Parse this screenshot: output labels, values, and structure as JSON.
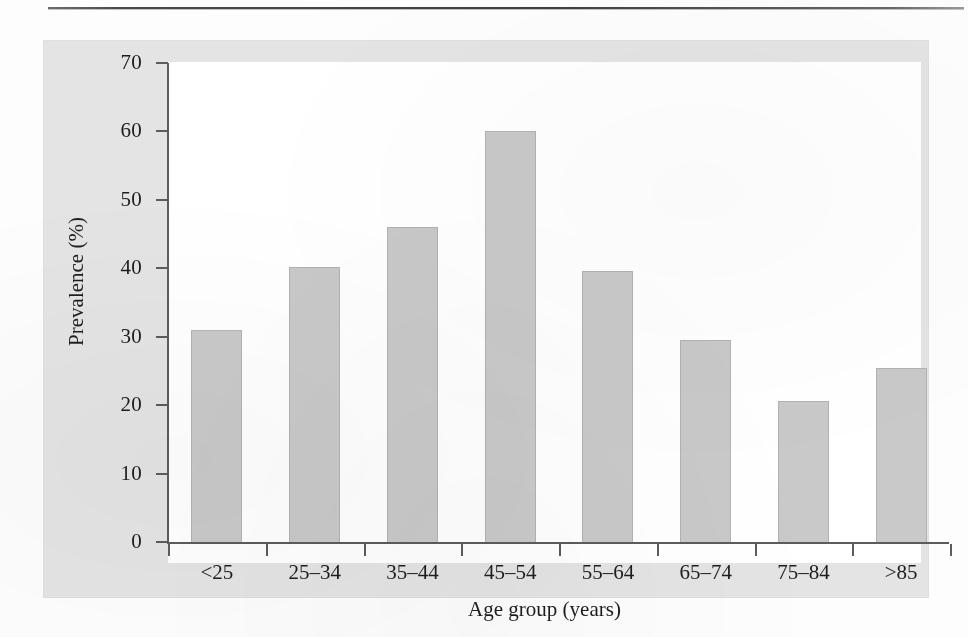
{
  "figure": {
    "panel_background": "#e4e4e4",
    "plot_background": "#ffffff",
    "bar_fill": "#c9c9c9",
    "bar_stroke": "#b2b2b2",
    "axis_color": "#5c5c5c",
    "text_color": "#1d1d1d",
    "rule_color": "#3f3f3f"
  },
  "chart_data": {
    "type": "bar",
    "title": "",
    "subtitle": "",
    "xlabel": "Age group (years)",
    "ylabel": "Prevalence (%)",
    "categories": [
      "<25",
      "25–34",
      "35–44",
      "45–54",
      "55–64",
      "65–74",
      "75–84",
      ">85"
    ],
    "values": [
      31.0,
      40.2,
      46.0,
      60.0,
      39.6,
      29.5,
      20.6,
      25.5
    ],
    "ylim": [
      0,
      70
    ],
    "yticks": [
      0,
      10,
      20,
      30,
      40,
      50,
      60,
      70
    ],
    "ytick_labels": [
      "0",
      "10",
      "20",
      "30",
      "40",
      "50",
      "60",
      "70"
    ],
    "xtick_labels": [
      "<25",
      "25–34",
      "35–44",
      "45–54",
      "55–64",
      "65–74",
      "75–84",
      ">85"
    ],
    "grid": false,
    "legend": null,
    "legend_position": "none",
    "annotations": [],
    "series": [
      {
        "name": "Prevalence",
        "values": [
          31.0,
          40.2,
          46.0,
          60.0,
          39.6,
          29.5,
          20.6,
          25.5
        ]
      }
    ]
  }
}
